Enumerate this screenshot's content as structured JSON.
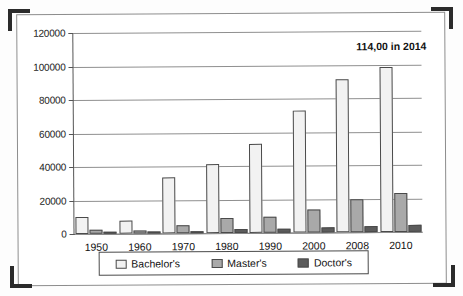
{
  "annotation": "114,00 in 2014",
  "legend": {
    "items": [
      {
        "label": "Bachelor's",
        "color": "#f2f2f2",
        "swatch": "bachelors-swatch"
      },
      {
        "label": "Master's",
        "color": "#a9a9a9",
        "swatch": "masters-swatch"
      },
      {
        "label": "Doctor's",
        "color": "#5c5c5c",
        "swatch": "doctors-swatch"
      }
    ]
  },
  "chart_data": {
    "type": "bar",
    "title": "",
    "xlabel": "",
    "ylabel": "",
    "ylim": [
      0,
      120000
    ],
    "ytick_step": 20000,
    "yticks": [
      "0",
      "20000",
      "40000",
      "60000",
      "80000",
      "100000",
      "120000"
    ],
    "grid": true,
    "legend_position": "bottom",
    "categories": [
      "1950",
      "1960",
      "1970",
      "1980",
      "1990",
      "2000",
      "2008",
      "2010"
    ],
    "series": [
      {
        "name": "Bachelor's",
        "color": "#f2f2f2",
        "values": [
          10000,
          7600,
          33400,
          41000,
          53000,
          73000,
          91500,
          98500
        ]
      },
      {
        "name": "Master's",
        "color": "#a9a9a9",
        "values": [
          2500,
          1800,
          5000,
          8800,
          9400,
          13500,
          19500,
          23000
        ]
      },
      {
        "name": "Doctor's",
        "color": "#5c5c5c",
        "values": [
          450,
          400,
          1300,
          2200,
          2600,
          3200,
          3500,
          4000
        ]
      }
    ],
    "annotations": [
      {
        "text": "114,00 in 2014",
        "position": "top-right"
      }
    ]
  }
}
